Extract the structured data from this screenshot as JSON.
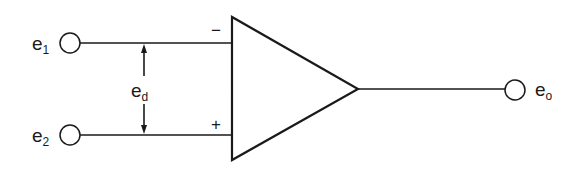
{
  "diagram": {
    "type": "operational-amplifier-symbol",
    "inputs": [
      {
        "label": "e",
        "subscript": "1",
        "polarity": "−"
      },
      {
        "label": "e",
        "subscript": "2",
        "polarity": "+"
      }
    ],
    "differential": {
      "label": "e",
      "subscript": "d"
    },
    "output": {
      "label": "e",
      "subscript": "o"
    },
    "colors": {
      "ink": "#1a1a1a",
      "background": "#ffffff"
    }
  }
}
